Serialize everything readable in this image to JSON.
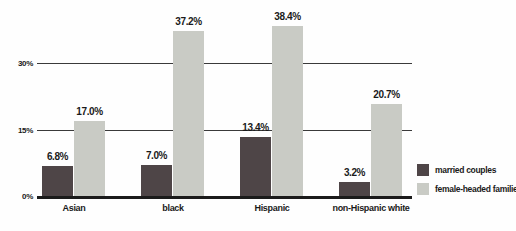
{
  "chart_data": {
    "type": "bar",
    "title": "",
    "xlabel": "",
    "ylabel": "",
    "categories": [
      "Asian",
      "black",
      "Hispanic",
      "non-Hispanic white"
    ],
    "series": [
      {
        "name": "married couples",
        "color": "#4e4547",
        "values": [
          6.8,
          7.0,
          13.4,
          3.2
        ],
        "labels": [
          "6.8%",
          "7.0%",
          "13.4%",
          "3.2%"
        ]
      },
      {
        "name": "female-headed families",
        "color": "#c9cbc5",
        "values": [
          17.0,
          37.2,
          38.4,
          20.7
        ],
        "labels": [
          "17.0%",
          "37.2%",
          "38.4%",
          "20.7%"
        ]
      }
    ],
    "yticks": [
      {
        "value": 0,
        "label": "0%"
      },
      {
        "value": 15,
        "label": "15%"
      },
      {
        "value": 30,
        "label": "30%"
      }
    ],
    "ylim": [
      0,
      44.5
    ],
    "grid": true,
    "legend_position": "right",
    "colors": {
      "gridline": "#3a3a3a",
      "baseline": "#1b1b1b",
      "text": "#1a1a1a",
      "background": "#fefefe"
    }
  }
}
